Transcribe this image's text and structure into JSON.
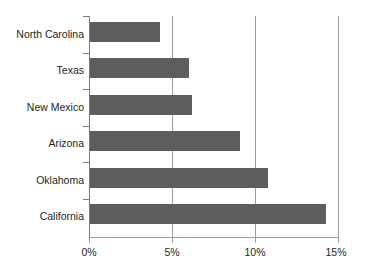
{
  "chart_data": {
    "type": "bar",
    "orientation": "horizontal",
    "title": "",
    "subtitle": "",
    "xlabel": "",
    "ylabel": "",
    "categories": [
      "North Carolina",
      "Texas",
      "New Mexico",
      "Arizona",
      "Oklahoma",
      "California"
    ],
    "values": [
      4.3,
      6.0,
      6.2,
      9.1,
      10.8,
      14.3
    ],
    "value_unit": "%",
    "xlim": [
      0,
      15
    ],
    "xticks": [
      0,
      5,
      10,
      15
    ],
    "xtick_labels": [
      "0%",
      "5%",
      "10%",
      "15%"
    ],
    "grid": "vertical",
    "legend": "none",
    "bar_color": "#5d5d5d",
    "axis_color": "#9d9d9d",
    "background": "#ffffff",
    "category_order": "top-to-bottom"
  },
  "axis": {
    "x_tick_labels": [
      "0%",
      "5%",
      "10%",
      "15%"
    ]
  }
}
